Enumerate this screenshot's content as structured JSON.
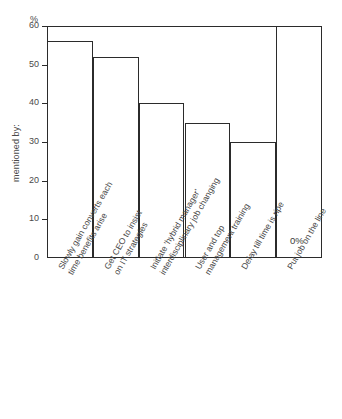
{
  "chart_data": {
    "type": "bar",
    "title": "",
    "xlabel": "",
    "ylabel": "mentioned by:",
    "unit_label": "%",
    "ylim": [
      0,
      60
    ],
    "yticks": [
      0,
      10,
      20,
      30,
      40,
      50,
      60
    ],
    "ytick_labels": [
      "0",
      "10",
      "20",
      "30",
      "40",
      "50",
      "60"
    ],
    "grid": false,
    "legend": "none",
    "categories": [
      "Slowly gain converts each time benefits arise",
      "Get CEO to insist on IT strategies",
      "Initiate 'hybrid manager' interdisciplinary job changing",
      "User and top management training",
      "Delay till time is ripe",
      "Put job on the line"
    ],
    "category_lines": [
      [
        "Slowly gain converts each",
        "time benefits arise"
      ],
      [
        "Get CEO to insist",
        "on IT strategies"
      ],
      [
        "Initiate 'hybrid manager'",
        "interdisciplinary job changing"
      ],
      [
        "User and top",
        "management training"
      ],
      [
        "Delay till time is ripe",
        ""
      ],
      [
        "Put job on the line",
        ""
      ]
    ],
    "values": [
      56,
      52,
      40,
      35,
      30,
      0
    ],
    "data_labels": [
      "",
      "",
      "",
      "",
      "",
      "0%"
    ]
  },
  "axes": {
    "y_title": "mentioned by:",
    "unit": "%"
  },
  "style": {
    "line_color": "#2b2b2b",
    "text_color": "#4a4a4a",
    "background": "#ffffff"
  }
}
